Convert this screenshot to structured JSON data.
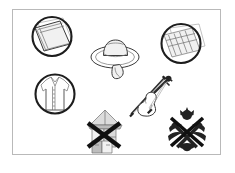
{
  "panel": {
    "title": "Line-art item illustration panel",
    "background_color": "#ffffff",
    "border_color": "#b9b9b9",
    "frame": {
      "x": 12,
      "y": 9,
      "width": 209,
      "height": 146
    }
  },
  "palette": {
    "outline": "#3a3a3a",
    "ring": "#1d1d1d",
    "shade_light": "#f1f1f1",
    "shade_mid": "#dcdcdc",
    "shade_dark": "#bdbdbd",
    "emblem_dark": "#232323",
    "cross_out": "#101010"
  },
  "items": [
    {
      "id": "circled-cushion",
      "label": "Circled square cushion",
      "icon": "cushion-icon",
      "marked_out": false,
      "circled": true,
      "position": {
        "x": 26,
        "y": 13
      }
    },
    {
      "id": "wide-brim-hat",
      "label": "Wide brim hat",
      "icon": "hat-icon",
      "marked_out": false,
      "circled": false,
      "position": {
        "x": 88,
        "y": 33
      }
    },
    {
      "id": "circled-tray",
      "label": "Circled ribbed tray",
      "icon": "tray-icon",
      "marked_out": false,
      "circled": true,
      "position": {
        "x": 155,
        "y": 17
      }
    },
    {
      "id": "circled-shirt",
      "label": "Circled button shirt",
      "icon": "shirt-icon",
      "marked_out": false,
      "circled": true,
      "position": {
        "x": 28,
        "y": 69
      }
    },
    {
      "id": "violin-and-bow",
      "label": "Violin with bow",
      "icon": "violin-icon",
      "marked_out": false,
      "circled": false,
      "position": {
        "x": 126,
        "y": 70
      }
    },
    {
      "id": "crossed-pavilion",
      "label": "Crossed out pavilion structure",
      "icon": "pavilion-icon",
      "marked_out": true,
      "circled": false,
      "position": {
        "x": 79,
        "y": 101
      }
    },
    {
      "id": "crossed-emblem",
      "label": "Crossed out floral emblem",
      "icon": "emblem-icon",
      "marked_out": true,
      "circled": false,
      "position": {
        "x": 163,
        "y": 106
      }
    }
  ]
}
